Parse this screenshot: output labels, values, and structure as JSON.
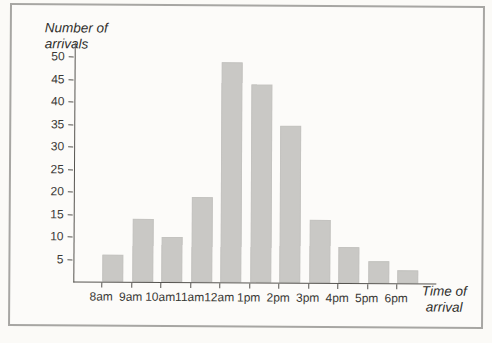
{
  "chart_data": {
    "type": "bar",
    "title": "",
    "ylabel": "Number of arrivals",
    "ylabel_lines": [
      "Number of",
      "arrivals"
    ],
    "xlabel": "Time of arrival",
    "xlabel_lines": [
      "Time of",
      "arrival"
    ],
    "categories": [
      "8am",
      "9am",
      "10am",
      "11am",
      "12am",
      "1pm",
      "2pm",
      "3pm",
      "4pm",
      "5pm",
      "6pm"
    ],
    "values": [
      6,
      14,
      10,
      19,
      49,
      44,
      35,
      14,
      8,
      5,
      3
    ],
    "yticks": [
      5,
      10,
      15,
      20,
      25,
      30,
      35,
      40,
      45,
      50
    ],
    "ylim": [
      0,
      52
    ],
    "grid": false,
    "legend": "none",
    "bar_color": "#c9c8c5",
    "axis_color": "#565450"
  },
  "colors": {
    "page_background": "#fbfaf7",
    "frame_background": "#fcfbf9",
    "frame_border": "#a7a6a3",
    "text": "#3a3936"
  }
}
